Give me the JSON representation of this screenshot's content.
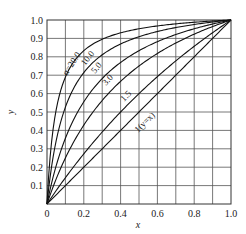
{
  "chart_data": {
    "type": "line",
    "title": "",
    "xlabel": "x",
    "ylabel": "y",
    "xlim": [
      0,
      1.0
    ],
    "ylim": [
      0,
      1.0
    ],
    "grid": true,
    "x_ticks": [
      "0",
      "0.2",
      "0.4",
      "0.6",
      "0.8",
      "1.0"
    ],
    "y_ticks": [
      "0.1",
      "0.2",
      "0.3",
      "0.4",
      "0.5",
      "0.6",
      "0.7",
      "0.8",
      "0.9",
      "1.0"
    ],
    "equation": "y = αx / (1 + (α − 1)x)",
    "x": [
      0,
      0.1,
      0.2,
      0.3,
      0.4,
      0.5,
      0.6,
      0.7,
      0.8,
      0.9,
      1.0
    ],
    "series": [
      {
        "name": "α=20.0",
        "label": "α=20.0",
        "alpha": 20.0,
        "values": [
          0,
          0.69,
          0.833,
          0.896,
          0.93,
          0.952,
          0.968,
          0.979,
          0.988,
          0.994,
          1.0
        ]
      },
      {
        "name": "10.0",
        "label": "10.0",
        "alpha": 10.0,
        "values": [
          0,
          0.526,
          0.714,
          0.811,
          0.87,
          0.909,
          0.938,
          0.959,
          0.976,
          0.989,
          1.0
        ]
      },
      {
        "name": "5.0",
        "label": "5.0",
        "alpha": 5.0,
        "values": [
          0,
          0.357,
          0.556,
          0.682,
          0.769,
          0.833,
          0.882,
          0.921,
          0.952,
          0.978,
          1.0
        ]
      },
      {
        "name": "3.0",
        "label": "3.0",
        "alpha": 3.0,
        "values": [
          0,
          0.25,
          0.429,
          0.563,
          0.667,
          0.75,
          0.818,
          0.875,
          0.923,
          0.964,
          1.0
        ]
      },
      {
        "name": "1.5",
        "label": "1.5",
        "alpha": 1.5,
        "values": [
          0,
          0.143,
          0.273,
          0.391,
          0.5,
          0.6,
          0.692,
          0.778,
          0.857,
          0.931,
          1.0
        ]
      },
      {
        "name": "1(y=x)",
        "label": "1(y=x)",
        "alpha": 1.0,
        "values": [
          0,
          0.1,
          0.2,
          0.3,
          0.4,
          0.5,
          0.6,
          0.7,
          0.8,
          0.9,
          1.0
        ]
      }
    ],
    "legend_position": "inline curve labels"
  }
}
